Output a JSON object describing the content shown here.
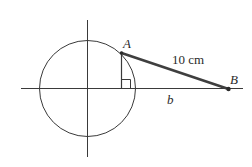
{
  "diagram": {
    "type": "geometry",
    "colors": {
      "stroke": "#3a3a3a",
      "thick_segment": "#3f3f3f",
      "background": "#ffffff",
      "text": "#2a2a2a"
    },
    "axes": {
      "horizontal": {
        "x1": 21,
        "y": 88.5,
        "x2": 243
      },
      "vertical": {
        "x": 87.5,
        "y1": 20,
        "y2": 157
      }
    },
    "circle": {
      "cx": 87.5,
      "cy": 88.5,
      "r": 48
    },
    "points": {
      "A": {
        "label": "A",
        "x": 121.5,
        "y": 53
      },
      "B": {
        "label": "B",
        "x": 228.5,
        "y": 89
      }
    },
    "segments": {
      "AB": {
        "label": "10 cm"
      },
      "base": {
        "label": "b"
      }
    },
    "right_angle_marker": {
      "x": 121,
      "y": 79.5,
      "size": 9
    }
  }
}
